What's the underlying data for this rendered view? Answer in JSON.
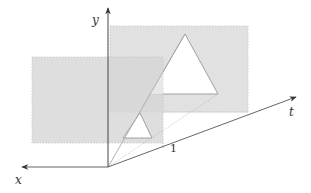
{
  "diagram": {
    "axes": {
      "x": {
        "label": "x"
      },
      "y": {
        "label": "y"
      },
      "t": {
        "label": "t"
      }
    },
    "tick": {
      "label": "1"
    },
    "planes": [
      {
        "name": "front-plane",
        "position": "t=0"
      },
      {
        "name": "back-plane",
        "position": "t=1"
      }
    ],
    "shapes": [
      {
        "name": "small-triangle",
        "plane": "front-plane"
      },
      {
        "name": "large-triangle",
        "plane": "back-plane"
      }
    ],
    "colors": {
      "plane_fill": "#d9d9d9",
      "plane_border": "#bdbdbd",
      "axis": "#555555",
      "projection_line": "#9a9a9a",
      "triangle_fill": "#ffffff",
      "triangle_stroke": "#9a9a9a"
    }
  }
}
